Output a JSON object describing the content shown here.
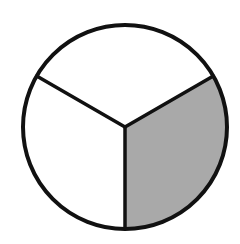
{
  "diagram": {
    "type": "fraction-circle",
    "total_parts": 3,
    "shaded_parts": 1,
    "fraction": "1/3",
    "center": [
      125,
      127
    ],
    "radius": 102,
    "stroke_color": "#111111",
    "shade_color": "#a9a9a9",
    "unshaded_color": "#ffffff",
    "sectors": [
      {
        "name": "top",
        "shaded": false,
        "start_angle_deg": -150,
        "end_angle_deg": -30
      },
      {
        "name": "lower-right",
        "shaded": true,
        "start_angle_deg": -30,
        "end_angle_deg": 90
      },
      {
        "name": "lower-left",
        "shaded": false,
        "start_angle_deg": 90,
        "end_angle_deg": 210
      }
    ]
  }
}
